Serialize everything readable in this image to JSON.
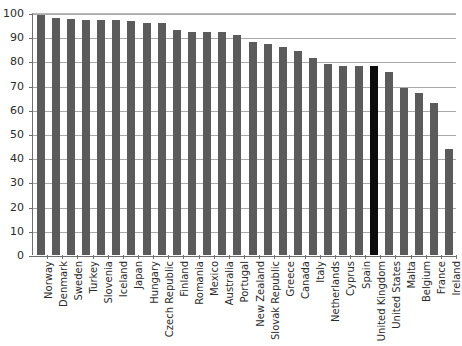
{
  "chart_data": {
    "type": "bar",
    "title": "",
    "subtitle": "",
    "xlabel": "",
    "ylabel": "",
    "ylim": [
      0,
      100
    ],
    "yticks": [
      0,
      10,
      20,
      30,
      40,
      50,
      60,
      70,
      80,
      90,
      100
    ],
    "ytick_labels": [
      "0",
      "10",
      "20",
      "30",
      "40",
      "50",
      "60",
      "70",
      "80",
      "90",
      "100"
    ],
    "grid": "horizontal",
    "legend": "none",
    "bar_color": "#5b5b5b",
    "highlight_color": "#0c0c0c",
    "highlight_category": "United Kingdom",
    "categories": [
      "Norway",
      "Denmark",
      "Sweden",
      "Turkey",
      "Slovenia",
      "Iceland",
      "Japan",
      "Hungary",
      "Czech Republic",
      "Finland",
      "Romania",
      "Mexico",
      "Australia",
      "Portugal",
      "New Zealand",
      "Slovak Republic",
      "Greece",
      "Canada",
      "Italy",
      "Netherlands",
      "Cyprus",
      "Spain",
      "United Kingdom",
      "United States",
      "Malta",
      "Belgium",
      "France",
      "Ireland"
    ],
    "values": [
      99,
      98,
      97.5,
      97,
      97,
      97,
      96.5,
      96,
      96,
      93,
      92,
      92,
      92,
      91,
      88,
      87,
      86,
      84.5,
      81.5,
      79,
      78,
      78,
      78,
      75.5,
      69,
      67,
      63,
      44
    ]
  }
}
